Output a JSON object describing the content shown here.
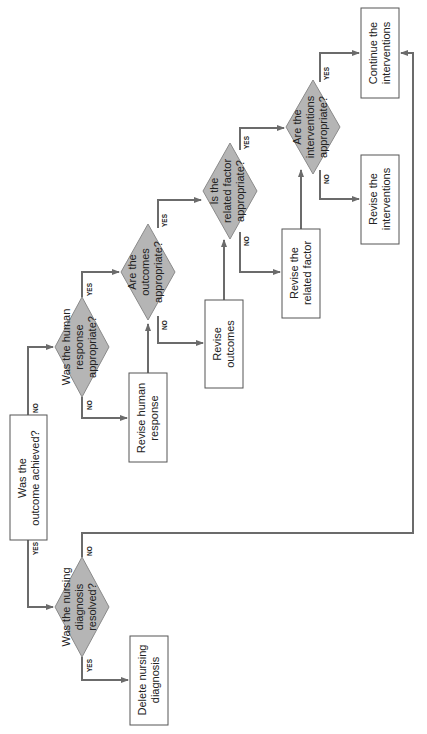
{
  "diagram": {
    "type": "flowchart",
    "orientation": "rotated-90-ccw",
    "colors": {
      "decision_fill": "#b5b5b5",
      "process_fill": "#ffffff",
      "connector": "#6b6b6b"
    },
    "nodes": {
      "start": {
        "kind": "process",
        "lines": [
          "Was the",
          "outcome achieved?"
        ]
      },
      "d_diagnosis": {
        "kind": "decision",
        "lines": [
          "Was the nursing",
          "diagnosis",
          "resolved?"
        ]
      },
      "delete": {
        "kind": "process",
        "lines": [
          "Delete nursing",
          "diagnosis"
        ]
      },
      "d_human": {
        "kind": "decision",
        "lines": [
          "Was the human",
          "response",
          "appropriate?"
        ]
      },
      "rev_human": {
        "kind": "process",
        "lines": [
          "Revise human",
          "response"
        ]
      },
      "d_outcomes": {
        "kind": "decision",
        "lines": [
          "Are the",
          "outcomes",
          "appropriate?"
        ]
      },
      "rev_outcomes": {
        "kind": "process",
        "lines": [
          "Revise",
          "outcomes"
        ]
      },
      "d_factor": {
        "kind": "decision",
        "lines": [
          "Is the",
          "related factor",
          "appropriate?"
        ]
      },
      "rev_factor": {
        "kind": "process",
        "lines": [
          "Revise the",
          "related factor"
        ]
      },
      "d_interventions": {
        "kind": "decision",
        "lines": [
          "Are the",
          "interventions",
          "appropriate?"
        ]
      },
      "rev_interventions": {
        "kind": "process",
        "lines": [
          "Revise the",
          "interventions"
        ]
      },
      "continue": {
        "kind": "process",
        "lines": [
          "Continue the",
          "interventions"
        ]
      }
    },
    "labels": {
      "yes": "YES",
      "no": "NO"
    },
    "edges": [
      {
        "from": "start",
        "to": "d_diagnosis",
        "label": "YES"
      },
      {
        "from": "start",
        "to": "d_human",
        "label": "NO"
      },
      {
        "from": "d_diagnosis",
        "to": "delete",
        "label": "YES"
      },
      {
        "from": "d_diagnosis",
        "to": "continue",
        "label": "NO"
      },
      {
        "from": "d_human",
        "to": "d_outcomes",
        "label": "YES"
      },
      {
        "from": "d_human",
        "to": "rev_human",
        "label": "NO"
      },
      {
        "from": "rev_human",
        "to": "d_outcomes",
        "label": ""
      },
      {
        "from": "d_outcomes",
        "to": "d_factor",
        "label": "YES"
      },
      {
        "from": "d_outcomes",
        "to": "rev_outcomes",
        "label": "NO"
      },
      {
        "from": "rev_outcomes",
        "to": "d_factor",
        "label": ""
      },
      {
        "from": "d_factor",
        "to": "d_interventions",
        "label": "YES"
      },
      {
        "from": "d_factor",
        "to": "rev_factor",
        "label": "NO"
      },
      {
        "from": "rev_factor",
        "to": "d_interventions",
        "label": ""
      },
      {
        "from": "d_interventions",
        "to": "continue",
        "label": "YES"
      },
      {
        "from": "d_interventions",
        "to": "rev_interventions",
        "label": "NO"
      }
    ]
  }
}
